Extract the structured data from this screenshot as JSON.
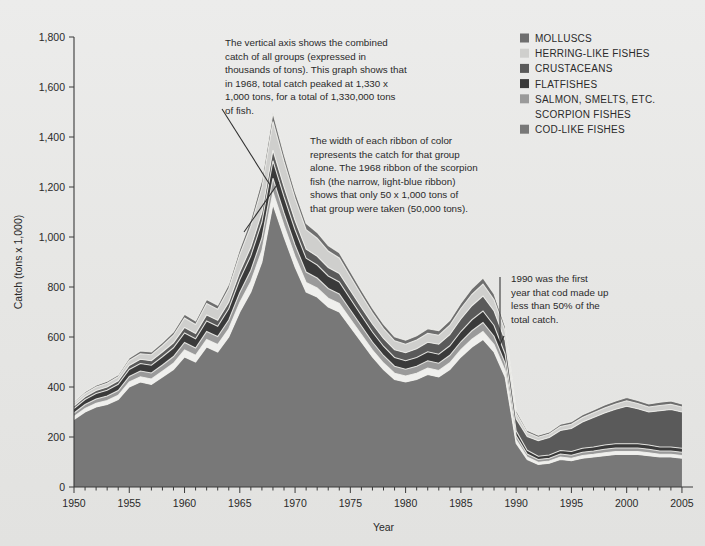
{
  "meta": {
    "background_color": "#e8e8e6",
    "text_color": "#2a2a2a"
  },
  "axes": {
    "y_title": "Catch (tons x 1,000)",
    "x_title": "Year",
    "y_ticks": [
      "0",
      "200",
      "400",
      "600",
      "800",
      "1,000",
      "1,200",
      "1,400",
      "1,600",
      "1,800"
    ],
    "x_ticks": [
      "1950",
      "1955",
      "1960",
      "1965",
      "1970",
      "1975",
      "1980",
      "1985",
      "1990",
      "1995",
      "2000",
      "2005"
    ]
  },
  "legend": {
    "items": [
      {
        "label": "MOLLUSCS",
        "color": "#6e6e6e",
        "has_swatch": true
      },
      {
        "label": "HERRING-LIKE FISHES",
        "color": "#cfcfcd",
        "has_swatch": true
      },
      {
        "label": "CRUSTACEANS",
        "color": "#5a5a5a",
        "has_swatch": true
      },
      {
        "label": "FLATFISHES",
        "color": "#3a3a3a",
        "has_swatch": true
      },
      {
        "label": "SALMON, SMELTS, ETC.",
        "color": "#9a9a9a",
        "has_swatch": true
      },
      {
        "label": "SCORPION FISHES",
        "color": "#efefed",
        "has_swatch": false
      },
      {
        "label": "COD-LIKE FISHES",
        "color": "#787878",
        "has_swatch": true
      }
    ]
  },
  "annotations": [
    {
      "name": "peak-annotation",
      "lines": [
        "The vertical axis shows the combined",
        "catch of all groups (expressed in",
        "thousands of tons). This graph shows that",
        "in 1968, total catch peaked at 1,330 x",
        "1,000 tons, for a total of 1,330,000 tons",
        "of fish."
      ]
    },
    {
      "name": "ribbon-width-annotation",
      "lines": [
        "The width of each ribbon of color",
        "represents the catch for that group",
        "alone. The 1968 ribbon of the scorpion",
        "fish (the narrow, light-blue ribbon)",
        "shows that only 50 x 1,000 tons of",
        "that group were taken (50,000 tons)."
      ]
    },
    {
      "name": "cod-1990-annotation",
      "lines": [
        "1990 was the first",
        "year that cod made up",
        "less than 50% of the",
        "total catch."
      ]
    }
  ],
  "chart_data": {
    "type": "area",
    "stacked": true,
    "title": "",
    "xlabel": "Year",
    "ylabel": "Catch (tons x 1,000)",
    "xlim": [
      1950,
      2006
    ],
    "ylim": [
      0,
      1800
    ],
    "grid": false,
    "legend_position": "top-right",
    "x": [
      1950,
      1951,
      1952,
      1953,
      1954,
      1955,
      1956,
      1957,
      1958,
      1959,
      1960,
      1961,
      1962,
      1963,
      1964,
      1965,
      1966,
      1967,
      1968,
      1969,
      1970,
      1971,
      1972,
      1973,
      1974,
      1975,
      1976,
      1977,
      1978,
      1979,
      1980,
      1981,
      1982,
      1983,
      1984,
      1985,
      1986,
      1987,
      1988,
      1989,
      1990,
      1991,
      1992,
      1993,
      1994,
      1995,
      1996,
      1997,
      1998,
      1999,
      2000,
      2001,
      2002,
      2003,
      2004,
      2005
    ],
    "stack_order_bottom_to_top": [
      "COD-LIKE FISHES",
      "SCORPION FISHES",
      "SALMON, SMELTS, ETC.",
      "FLATFISHES",
      "CRUSTACEANS",
      "HERRING-LIKE FISHES",
      "MOLLUSCS"
    ],
    "series": [
      {
        "name": "COD-LIKE FISHES",
        "color": "#787878",
        "values": [
          270,
          300,
          320,
          330,
          350,
          400,
          420,
          410,
          440,
          470,
          520,
          500,
          560,
          540,
          600,
          700,
          780,
          900,
          1130,
          1000,
          880,
          780,
          760,
          720,
          700,
          640,
          580,
          520,
          470,
          430,
          420,
          430,
          450,
          440,
          470,
          520,
          560,
          590,
          540,
          440,
          175,
          110,
          90,
          95,
          110,
          105,
          115,
          120,
          125,
          130,
          130,
          130,
          125,
          120,
          120,
          115
        ]
      },
      {
        "name": "SCORPION FISHES",
        "color": "#efefed",
        "values": [
          12,
          14,
          15,
          16,
          17,
          20,
          21,
          22,
          23,
          25,
          28,
          27,
          30,
          30,
          33,
          38,
          42,
          46,
          50,
          46,
          42,
          38,
          36,
          35,
          34,
          32,
          30,
          28,
          26,
          25,
          24,
          25,
          26,
          26,
          27,
          29,
          31,
          32,
          30,
          26,
          14,
          10,
          9,
          9,
          10,
          10,
          11,
          11,
          12,
          12,
          12,
          12,
          12,
          11,
          11,
          11
        ]
      },
      {
        "name": "SALMON, SMELTS, ETC.",
        "color": "#9a9a9a",
        "values": [
          14,
          16,
          17,
          18,
          19,
          22,
          23,
          24,
          25,
          27,
          30,
          29,
          32,
          32,
          35,
          40,
          45,
          50,
          55,
          50,
          46,
          42,
          40,
          39,
          38,
          36,
          34,
          32,
          30,
          28,
          27,
          28,
          29,
          29,
          30,
          32,
          34,
          36,
          33,
          29,
          16,
          12,
          11,
          11,
          12,
          12,
          13,
          13,
          14,
          14,
          14,
          14,
          14,
          13,
          13,
          13
        ]
      },
      {
        "name": "FLATFISHES",
        "color": "#3a3a3a",
        "values": [
          18,
          20,
          22,
          23,
          25,
          28,
          30,
          31,
          33,
          35,
          38,
          37,
          42,
          41,
          45,
          52,
          58,
          64,
          70,
          65,
          60,
          55,
          52,
          50,
          48,
          45,
          42,
          40,
          37,
          35,
          34,
          35,
          36,
          36,
          38,
          41,
          44,
          46,
          43,
          37,
          20,
          15,
          13,
          13,
          14,
          15,
          16,
          16,
          17,
          17,
          17,
          17,
          17,
          16,
          16,
          16
        ]
      },
      {
        "name": "CRUSTACEANS",
        "color": "#5a5a5a",
        "values": [
          10,
          11,
          12,
          13,
          14,
          16,
          17,
          18,
          19,
          20,
          22,
          21,
          24,
          24,
          26,
          30,
          34,
          38,
          42,
          40,
          38,
          36,
          35,
          34,
          34,
          33,
          32,
          32,
          31,
          31,
          32,
          35,
          38,
          40,
          44,
          50,
          56,
          60,
          58,
          54,
          48,
          55,
          62,
          70,
          80,
          92,
          105,
          118,
          128,
          138,
          150,
          140,
          132,
          145,
          150,
          145
        ]
      },
      {
        "name": "HERRING-LIKE FISHES",
        "color": "#cfcfcd",
        "values": [
          12,
          13,
          14,
          15,
          16,
          20,
          22,
          24,
          26,
          30,
          38,
          36,
          46,
          44,
          54,
          70,
          85,
          100,
          115,
          100,
          88,
          78,
          72,
          66,
          62,
          56,
          50,
          45,
          40,
          36,
          34,
          35,
          36,
          36,
          38,
          42,
          46,
          48,
          45,
          38,
          22,
          16,
          14,
          14,
          16,
          17,
          18,
          19,
          20,
          21,
          22,
          21,
          20,
          21,
          21,
          20
        ]
      },
      {
        "name": "MOLLUSCS",
        "color": "#6e6e6e",
        "values": [
          6,
          7,
          7,
          8,
          8,
          10,
          11,
          11,
          12,
          13,
          15,
          14,
          16,
          16,
          18,
          22,
          26,
          30,
          34,
          30,
          27,
          25,
          23,
          22,
          21,
          20,
          19,
          18,
          17,
          16,
          16,
          17,
          18,
          18,
          19,
          21,
          23,
          24,
          23,
          20,
          12,
          9,
          8,
          8,
          9,
          10,
          11,
          11,
          12,
          12,
          13,
          12,
          12,
          13,
          13,
          12
        ]
      }
    ],
    "notable_points": [
      {
        "year": 1968,
        "label": "peak total",
        "total": 1330
      },
      {
        "year": 1990,
        "label": "cod below 50% of total catch",
        "total": 307
      }
    ]
  }
}
